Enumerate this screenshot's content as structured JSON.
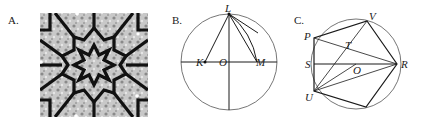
{
  "figure": {
    "panels": [
      {
        "label": "A.",
        "description": "Islamic star-pattern tile (12-pointed star rosette) photo"
      },
      {
        "label": "B.",
        "points": {
          "L": "L",
          "K": "K",
          "O": "O",
          "M": "M"
        }
      },
      {
        "label": "C.",
        "points": {
          "V": "V",
          "P": "P",
          "T": "T",
          "S": "S",
          "O": "O",
          "R": "R",
          "U": "U"
        }
      }
    ],
    "colors": {
      "line": "#1a1a1a",
      "circle": "#555555",
      "tile_bg": "#b8b8b8"
    }
  }
}
